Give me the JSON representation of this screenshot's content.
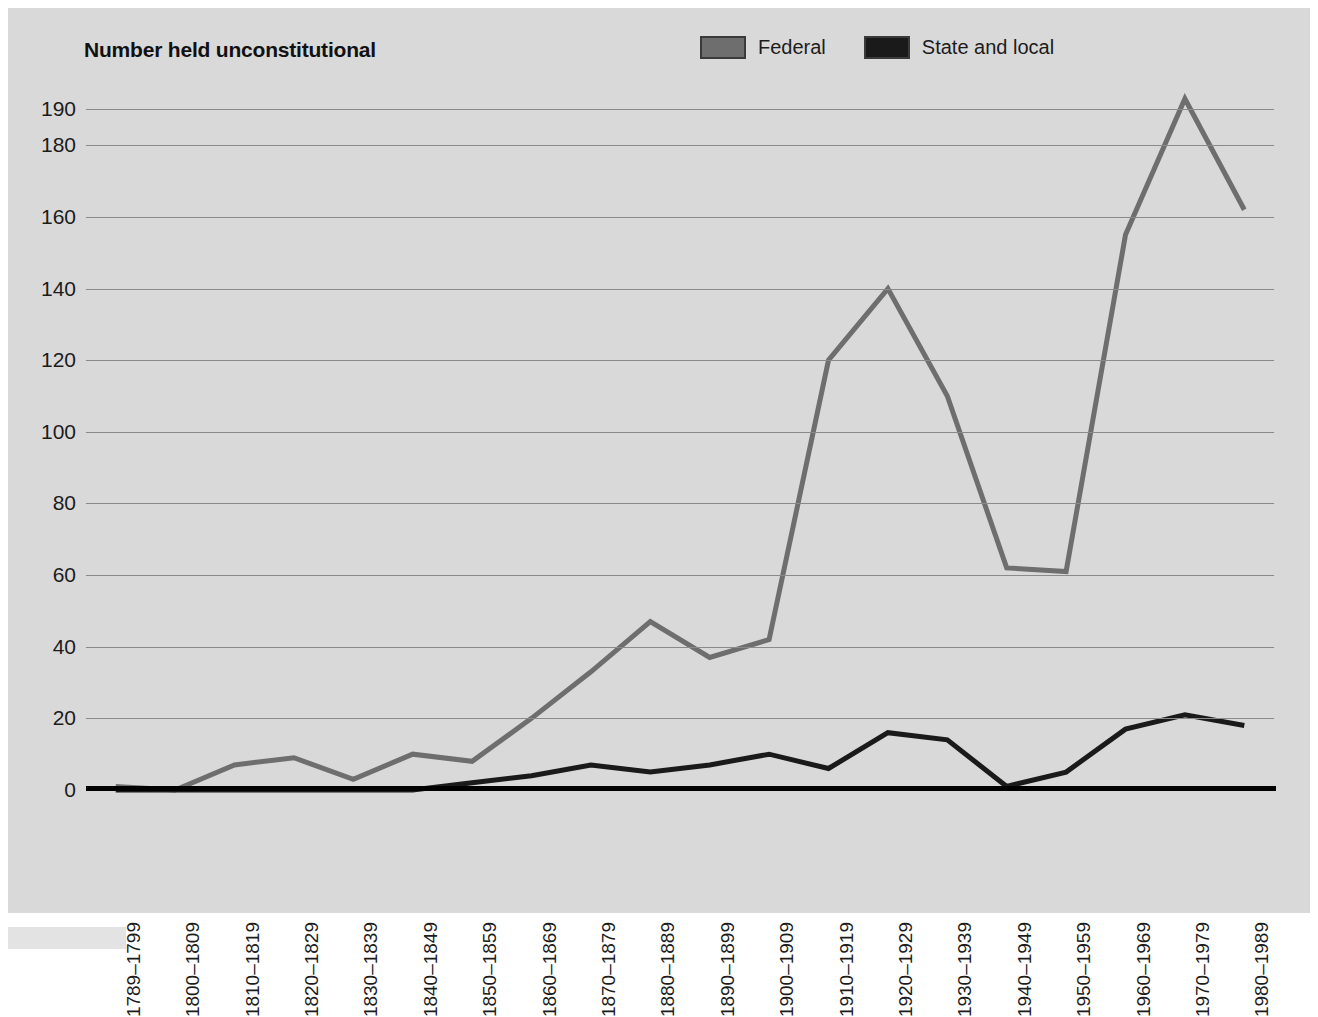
{
  "chart_data": {
    "type": "line",
    "title": "Number held unconstitutional",
    "xlabel": "",
    "ylabel": "",
    "ylim": [
      0,
      196
    ],
    "yticks": [
      0,
      20,
      40,
      60,
      80,
      100,
      120,
      140,
      160,
      180,
      190
    ],
    "ytick_labels": [
      "0",
      "20",
      "40",
      "60",
      "80",
      "100",
      "120",
      "140",
      "160",
      "180",
      "190"
    ],
    "grid": true,
    "legend_position": "top-right",
    "categories": [
      "1789–1799",
      "1800–1809",
      "1810–1819",
      "1820–1829",
      "1830–1839",
      "1840–1849",
      "1850–1859",
      "1860–1869",
      "1870–1879",
      "1880–1889",
      "1890–1899",
      "1900–1909",
      "1910–1919",
      "1920–1929",
      "1930–1939",
      "1940–1949",
      "1950–1959",
      "1960–1969",
      "1970–1979",
      "1980–1989"
    ],
    "series": [
      {
        "name": "Federal",
        "color": "#6e6e6e",
        "values": [
          1,
          0,
          7,
          9,
          3,
          10,
          8,
          20,
          33,
          47,
          37,
          42,
          120,
          140,
          110,
          62,
          61,
          155,
          193,
          162
        ]
      },
      {
        "name": "State and local",
        "color": "#1a1a1a",
        "values": [
          0,
          0,
          0,
          0,
          0,
          0,
          2,
          4,
          7,
          5,
          7,
          10,
          6,
          16,
          14,
          1,
          5,
          17,
          21,
          18
        ]
      }
    ]
  },
  "legend": {
    "items": [
      {
        "label": "Federal",
        "color": "#6e6e6e"
      },
      {
        "label": "State and local",
        "color": "#1a1a1a"
      }
    ]
  }
}
